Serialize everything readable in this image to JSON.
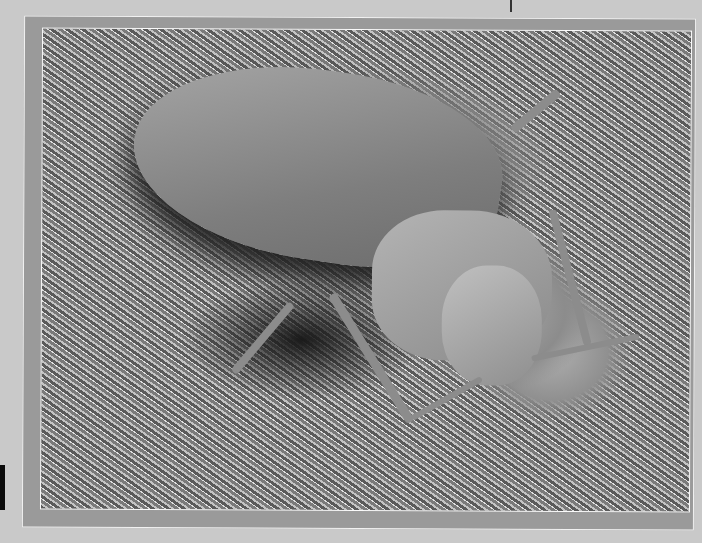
{
  "image": {
    "description": "Grayscale scanning electron micrograph of a bed bug-like insect resting on fibrous fabric, printed in a gray framed border on a scanned page",
    "colors": {
      "page": "#c9c9c9",
      "frame": "#9a9a9a",
      "frame_line": "#f2f2f2"
    }
  }
}
